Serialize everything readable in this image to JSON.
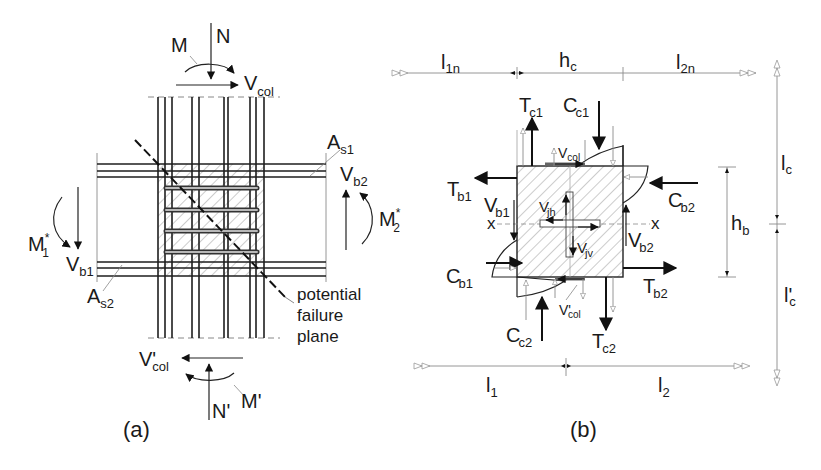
{
  "figure": {
    "panels": [
      {
        "id": "a",
        "caption": "(a)",
        "title": "Beam-column joint reinforcement and actions",
        "labels": {
          "moment_top": "M",
          "axial_top": "N",
          "shear_col_top": "V",
          "shear_col_top_sub": "col",
          "steel_top": "A",
          "steel_top_sub": "s1",
          "steel_bottom": "A",
          "steel_bottom_sub": "s2",
          "beam_shear_right": "V",
          "beam_shear_right_sub": "b2",
          "beam_moment_right": "M",
          "beam_moment_right_sup": "*",
          "beam_moment_right_sub": "2",
          "beam_moment_left": "M",
          "beam_moment_left_sup": "*",
          "beam_moment_left_sub": "1",
          "beam_shear_left": "V",
          "beam_shear_left_sub": "b1",
          "shear_col_bottom": "V'",
          "shear_col_bottom_sub": "col",
          "axial_bottom": "N'",
          "moment_bottom": "M'",
          "failure_plane_line1": "potential",
          "failure_plane_line2": "failure",
          "failure_plane_line3": "plane"
        }
      },
      {
        "id": "b",
        "caption": "(b)",
        "title": "Free-body diagram of joint forces",
        "dimensions": {
          "l1n": {
            "main": "l",
            "sub": "1n"
          },
          "hc": {
            "main": "h",
            "sub": "c"
          },
          "l2n": {
            "main": "l",
            "sub": "2n"
          },
          "lc": {
            "main": "l",
            "sub": "c"
          },
          "lc_prime": {
            "main": "l'",
            "sub": "c"
          },
          "hb": {
            "main": "h",
            "sub": "b"
          },
          "l1": {
            "main": "l",
            "sub": "1"
          },
          "l2": {
            "main": "l",
            "sub": "2"
          }
        },
        "forces": {
          "Tc1": {
            "main": "T",
            "sub": "c1"
          },
          "Cc1": {
            "main": "C",
            "sub": "c1"
          },
          "Vcol": {
            "main": "V",
            "sub": "col"
          },
          "Tb1": {
            "main": "T",
            "sub": "b1"
          },
          "Cb2": {
            "main": "C",
            "sub": "b2"
          },
          "Vb1": {
            "main": "V",
            "sub": "b1"
          },
          "Vjh": {
            "main": "V",
            "sub": "jh"
          },
          "Vjv": {
            "main": "V",
            "sub": "jv"
          },
          "Vb2": {
            "main": "V",
            "sub": "b2"
          },
          "Cb1": {
            "main": "C",
            "sub": "b1"
          },
          "Tb2": {
            "main": "T",
            "sub": "b2"
          },
          "Vcol_prime": {
            "main": "V'",
            "sub": "col"
          },
          "Cc2": {
            "main": "C",
            "sub": "c2"
          },
          "Tc2": {
            "main": "T",
            "sub": "c2"
          },
          "axis_left": "x",
          "axis_right": "x"
        }
      }
    ]
  }
}
